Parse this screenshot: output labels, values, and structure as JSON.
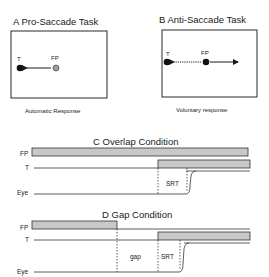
{
  "panels": {
    "a": {
      "title": "A Pro-Saccade Task",
      "target_label": "T",
      "fixation_label": "FP",
      "caption": "Automatic Response"
    },
    "b": {
      "title": "B Anti-Saccade Task",
      "target_label": "T",
      "fixation_label": "FP",
      "caption": "Voluntary response"
    },
    "c": {
      "title": "C Overlap Condition",
      "rows": [
        "FP",
        "T",
        "Eye"
      ],
      "interval_label": "SRT"
    },
    "d": {
      "title": "D Gap Condition",
      "rows": [
        "FP",
        "T",
        "Eye"
      ],
      "gap_label": "gap",
      "interval_label": "SRT"
    }
  },
  "colors": {
    "bar_fill": "#c8c8c8",
    "ink": "#1a1a1a",
    "fp_dot_a": "#9a9a9a"
  }
}
